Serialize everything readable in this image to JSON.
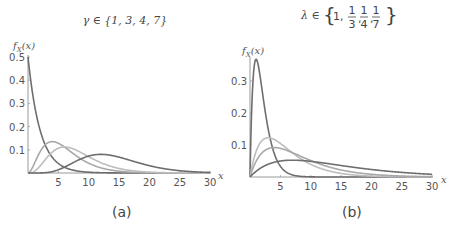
{
  "chart_data": [
    {
      "type": "line",
      "panel": "(a)",
      "title": "γ ∈ {1, 3, 4, 7}",
      "title_symbol": "γ",
      "title_set": [
        "1",
        "3",
        "4",
        "7"
      ],
      "xlabel": "x",
      "ylabel": "f_X(x)",
      "xlim": [
        0,
        30
      ],
      "ylim": [
        0,
        0.5
      ],
      "xticks": [
        5,
        10,
        15,
        20,
        25,
        30
      ],
      "yticks": [
        0.1,
        0.2,
        0.3,
        0.4,
        0.5
      ],
      "grid": false,
      "distribution": "gamma",
      "fixed_rate": 0.5,
      "series": [
        {
          "name": "γ = 1",
          "shape": 1,
          "rate": 0.5,
          "color": "#6e6e6e",
          "peak": {
            "x": 0,
            "y": 0.5
          }
        },
        {
          "name": "γ = 3",
          "shape": 3,
          "rate": 0.5,
          "color": "#a8a8a8",
          "peak": {
            "x": 4,
            "y": 0.135
          }
        },
        {
          "name": "γ = 4",
          "shape": 4,
          "rate": 0.5,
          "color": "#bdbdbd",
          "peak": {
            "x": 6,
            "y": 0.112
          }
        },
        {
          "name": "γ = 7",
          "shape": 7,
          "rate": 0.5,
          "color": "#6e6e6e",
          "peak": {
            "x": 12,
            "y": 0.08
          }
        }
      ]
    },
    {
      "type": "line",
      "panel": "(b)",
      "title": "λ ∈ {1, 1/3, 1/4, 1/7}",
      "title_symbol": "λ",
      "title_set": [
        "1",
        "1/3",
        "1/4",
        "1/7"
      ],
      "xlabel": "x",
      "ylabel": "f_X(x)",
      "xlim": [
        0,
        30
      ],
      "ylim": [
        0,
        0.37
      ],
      "xticks": [
        5,
        10,
        15,
        20,
        25,
        30
      ],
      "yticks": [
        0.1,
        0.2,
        0.3
      ],
      "grid": false,
      "distribution": "gamma",
      "fixed_shape": 2,
      "series": [
        {
          "name": "λ = 1",
          "shape": 2,
          "rate": 1,
          "color": "#6e6e6e",
          "peak": {
            "x": 1,
            "y": 0.368
          }
        },
        {
          "name": "λ = 1/3",
          "shape": 2,
          "rate": 0.3333,
          "color": "#bdbdbd",
          "peak": {
            "x": 3,
            "y": 0.123
          }
        },
        {
          "name": "λ = 1/4",
          "shape": 2,
          "rate": 0.25,
          "color": "#a8a8a8",
          "peak": {
            "x": 4,
            "y": 0.092
          }
        },
        {
          "name": "λ = 1/7",
          "shape": 2,
          "rate": 0.142857,
          "color": "#6e6e6e",
          "peak": {
            "x": 7,
            "y": 0.053
          }
        }
      ]
    }
  ],
  "panels": {
    "a": {
      "caption": "(a)",
      "ylabel_f": "f",
      "ylabel_sub": "X",
      "ylabel_arg": "(x)",
      "xlabel": "x",
      "title_symbol": "γ ∈ {1, 3, 4, 7}"
    },
    "b": {
      "caption": "(b)",
      "ylabel_f": "f",
      "ylabel_sub": "X",
      "ylabel_arg": "(x)",
      "xlabel": "x",
      "title_symbol": "λ ∈",
      "title_one": "1,",
      "fracs": [
        {
          "num": "1",
          "den": "3"
        },
        {
          "num": "1",
          "den": "4"
        },
        {
          "num": "1",
          "den": "7"
        }
      ]
    }
  }
}
